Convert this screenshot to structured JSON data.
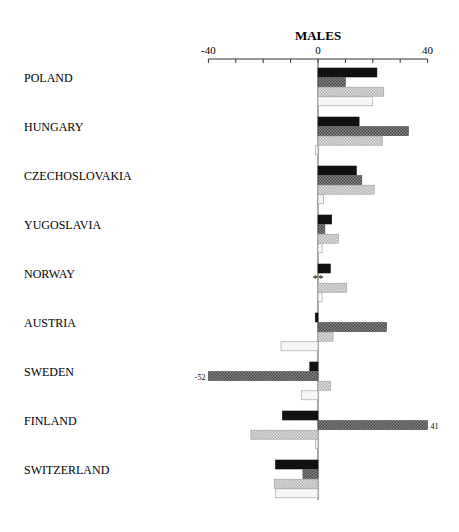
{
  "chart_data": {
    "type": "bar",
    "orientation": "horizontal",
    "title": "MALES",
    "xlabel": "",
    "ylabel": "",
    "xlim": [
      -40,
      40
    ],
    "x_ticks": [
      -40,
      -30,
      -20,
      -10,
      0,
      10,
      20,
      30,
      40
    ],
    "x_tick_labels": [
      "-40",
      "0",
      "40"
    ],
    "grid": false,
    "legend": null,
    "categories": [
      "POLAND",
      "HUNGARY",
      "CZECHOSLOVAKIA",
      "YUGOSLAVIA",
      "NORWAY",
      "AUSTRIA",
      "SWEDEN",
      "FINLAND",
      "SWITZERLAND"
    ],
    "series": [
      {
        "name": "series-1 (black)",
        "pattern": "solid-black",
        "values": [
          21.5,
          15,
          14,
          5,
          4.5,
          -1,
          -3,
          -13,
          -15.5
        ]
      },
      {
        "name": "series-2 (dark hatch)",
        "pattern": "dark-crosshatch",
        "values": [
          10,
          33,
          16,
          2.5,
          null,
          25,
          -52,
          41,
          -5.5
        ]
      },
      {
        "name": "series-3 (light hatch)",
        "pattern": "light-crosshatch",
        "values": [
          24,
          23.5,
          20.5,
          7.5,
          10.5,
          5.5,
          4.5,
          -24.5,
          -16
        ]
      },
      {
        "name": "series-4 (white)",
        "pattern": "near-white",
        "values": [
          20,
          -1,
          2,
          1.5,
          1.5,
          -13.5,
          -6,
          -1,
          -15.5
        ]
      }
    ],
    "annotations": [
      {
        "category": "NORWAY",
        "series": 1,
        "text": "**"
      },
      {
        "category": "SWEDEN",
        "series": 1,
        "text": "-52"
      },
      {
        "category": "FINLAND",
        "series": 1,
        "text": "41"
      }
    ]
  }
}
